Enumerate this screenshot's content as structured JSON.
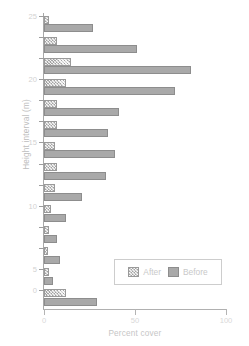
{
  "chart_data": {
    "type": "bar",
    "orientation": "horizontal",
    "title": "",
    "xlabel": "Percent cover",
    "ylabel": "Height interval (m)",
    "xlim": [
      0,
      100
    ],
    "xticks": [
      0,
      50,
      100
    ],
    "xtick_labels": [
      "0",
      "50",
      "100"
    ],
    "grid": false,
    "legend_position": "lower-right",
    "categories": [
      "26",
      "24",
      "22",
      "20",
      "18",
      "16",
      "14",
      "12",
      "10",
      "8",
      "6",
      "4",
      "2",
      "0"
    ],
    "ytick_labels": [
      "25",
      "",
      "",
      "20",
      "",
      "",
      "15",
      "",
      "",
      "10",
      "",
      "",
      "5",
      "0"
    ],
    "series": [
      {
        "name": "After",
        "values": [
          3,
          7,
          15,
          12,
          7,
          7,
          6,
          7,
          6,
          4,
          3,
          2,
          3,
          12
        ]
      },
      {
        "name": "Before",
        "values": [
          27,
          51,
          81,
          72,
          41,
          35,
          39,
          34,
          21,
          12,
          7,
          9,
          5,
          29
        ]
      }
    ]
  },
  "legend": {
    "items": [
      {
        "label": "After",
        "key": "after"
      },
      {
        "label": "Before",
        "key": "before"
      }
    ]
  },
  "colors": {
    "before_fill": "#a9a9a9",
    "after_fill": "#cfcfcf",
    "axis": "#a8a8a8",
    "text": "#c9c9c9"
  }
}
